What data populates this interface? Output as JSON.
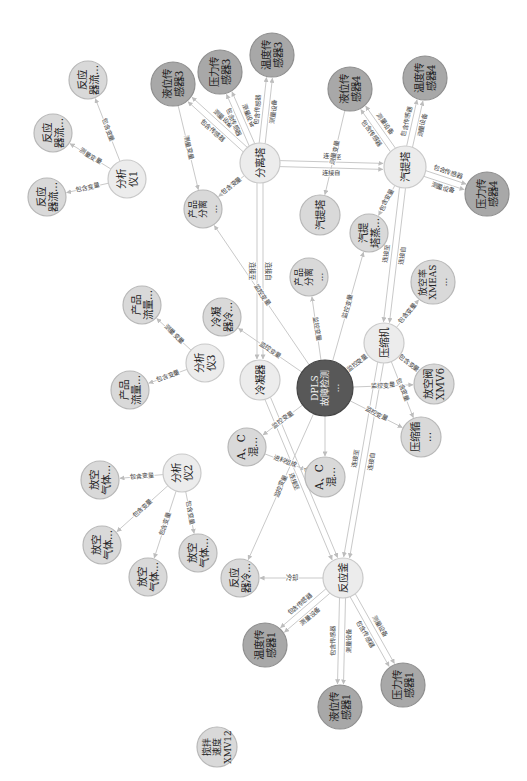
{
  "styles": {
    "edge_color": "#c9c9c9",
    "arrow_color": "#bdbdbd",
    "node_types": {
      "sensor": {
        "fill": "#a8a8a8",
        "stroke": "#8f8f8f",
        "text": "#1e1e1e"
      },
      "core": {
        "fill": "#585858",
        "stroke": "#454545",
        "text": "#f2f2f2"
      },
      "light": {
        "fill": "#ececec",
        "stroke": "#c9c9c9",
        "text": "#242424"
      },
      "medium": {
        "fill": "#d9d9d9",
        "stroke": "#b8b8b8",
        "text": "#242424"
      }
    }
  },
  "graph": {
    "nodes": [
      {
        "id": "fy1a",
        "type": "medium",
        "x": 88,
        "y": 80,
        "r": 19,
        "lines": [
          "反应",
          "器流..."
        ]
      },
      {
        "id": "fy1b",
        "type": "medium",
        "x": 53,
        "y": 133,
        "r": 19,
        "lines": [
          "反应",
          "器流..."
        ]
      },
      {
        "id": "fy1c",
        "type": "medium",
        "x": 47,
        "y": 197,
        "r": 19,
        "lines": [
          "反应",
          "器流..."
        ]
      },
      {
        "id": "fxy1",
        "type": "light",
        "x": 127,
        "y": 179,
        "r": 19,
        "lines": [
          "分析",
          "仪1"
        ]
      },
      {
        "id": "yw3",
        "type": "sensor",
        "x": 173,
        "y": 84,
        "r": 22,
        "lines": [
          "液位传",
          "感器3"
        ]
      },
      {
        "id": "yl3",
        "type": "sensor",
        "x": 220,
        "y": 72,
        "r": 22,
        "lines": [
          "压力传",
          "感器3"
        ]
      },
      {
        "id": "wd3",
        "type": "sensor",
        "x": 272,
        "y": 55,
        "r": 22,
        "lines": [
          "温度传",
          "感器3"
        ]
      },
      {
        "id": "flt",
        "type": "light",
        "x": 260,
        "y": 163,
        "r": 20,
        "lines": [
          "分离塔"
        ]
      },
      {
        "id": "cpfl1",
        "type": "medium",
        "x": 203,
        "y": 209,
        "r": 19,
        "lines": [
          "产品",
          "分离",
          "..."
        ]
      },
      {
        "id": "yw4",
        "type": "sensor",
        "x": 350,
        "y": 89,
        "r": 22,
        "lines": [
          "液位传",
          "感器4"
        ]
      },
      {
        "id": "wd4",
        "type": "sensor",
        "x": 425,
        "y": 78,
        "r": 22,
        "lines": [
          "温度传",
          "感器4"
        ]
      },
      {
        "id": "qtt",
        "type": "light",
        "x": 405,
        "y": 167,
        "r": 21,
        "lines": [
          "汽提塔"
        ]
      },
      {
        "id": "yl4",
        "type": "sensor",
        "x": 487,
        "y": 194,
        "r": 22,
        "lines": [
          "压力传",
          "感器4"
        ]
      },
      {
        "id": "qtt2",
        "type": "medium",
        "x": 320,
        "y": 215,
        "r": 20,
        "lines": [
          "汽提塔"
        ]
      },
      {
        "id": "qtz",
        "type": "medium",
        "x": 369,
        "y": 233,
        "r": 19,
        "lines": [
          "汽提",
          "塔蒸..."
        ]
      },
      {
        "id": "cpfl2",
        "type": "medium",
        "x": 309,
        "y": 277,
        "r": 19,
        "lines": [
          "产品",
          "分离",
          "..."
        ]
      },
      {
        "id": "fkl",
        "type": "medium",
        "x": 433,
        "y": 282,
        "r": 22,
        "lines": [
          "放空率",
          "XMEAS",
          "..."
        ]
      },
      {
        "id": "ysj",
        "type": "light",
        "x": 384,
        "y": 343,
        "r": 20,
        "lines": [
          "压缩机"
        ]
      },
      {
        "id": "dpls",
        "type": "core",
        "x": 325,
        "y": 388,
        "r": 28,
        "lines": [
          "DPLS",
          "故障检测",
          "..."
        ]
      },
      {
        "id": "fkf",
        "type": "medium",
        "x": 434,
        "y": 384,
        "r": 20,
        "lines": [
          "放空阀",
          "XMV6"
        ]
      },
      {
        "id": "ysx",
        "type": "medium",
        "x": 421,
        "y": 437,
        "r": 20,
        "lines": [
          "压缩循",
          "..."
        ]
      },
      {
        "id": "lnq",
        "type": "light",
        "x": 260,
        "y": 380,
        "r": 20,
        "lines": [
          "冷凝器"
        ]
      },
      {
        "id": "lnql",
        "type": "medium",
        "x": 222,
        "y": 317,
        "r": 19,
        "lines": [
          "冷凝",
          "器冷..."
        ]
      },
      {
        "id": "cpll1",
        "type": "medium",
        "x": 142,
        "y": 305,
        "r": 19,
        "lines": [
          "产品",
          "流量..."
        ]
      },
      {
        "id": "fxy3",
        "type": "light",
        "x": 205,
        "y": 363,
        "r": 19,
        "lines": [
          "分析",
          "仪3"
        ]
      },
      {
        "id": "cpll2",
        "type": "medium",
        "x": 130,
        "y": 390,
        "r": 19,
        "lines": [
          "产品",
          "流量..."
        ]
      },
      {
        "id": "ac1",
        "type": "medium",
        "x": 247,
        "y": 447,
        "r": 19,
        "lines": [
          "A、C",
          "混..."
        ]
      },
      {
        "id": "ac2",
        "type": "medium",
        "x": 325,
        "y": 477,
        "r": 20,
        "lines": [
          "A、C",
          "混..."
        ]
      },
      {
        "id": "fxy2",
        "type": "light",
        "x": 182,
        "y": 473,
        "r": 19,
        "lines": [
          "分析",
          "仪2"
        ]
      },
      {
        "id": "fkqt1",
        "type": "medium",
        "x": 100,
        "y": 480,
        "r": 19,
        "lines": [
          "放空",
          "气体..."
        ]
      },
      {
        "id": "fkqt2",
        "type": "medium",
        "x": 102,
        "y": 545,
        "r": 19,
        "lines": [
          "放空",
          "气体..."
        ]
      },
      {
        "id": "fkqt3",
        "type": "medium",
        "x": 148,
        "y": 577,
        "r": 19,
        "lines": [
          "放空",
          "气体..."
        ]
      },
      {
        "id": "fkqt4",
        "type": "medium",
        "x": 198,
        "y": 553,
        "r": 19,
        "lines": [
          "放空",
          "气体..."
        ]
      },
      {
        "id": "fyql",
        "type": "medium",
        "x": 240,
        "y": 578,
        "r": 19,
        "lines": [
          "反应",
          "器冷..."
        ]
      },
      {
        "id": "fyf",
        "type": "light",
        "x": 343,
        "y": 578,
        "r": 20,
        "lines": [
          "反应釜"
        ]
      },
      {
        "id": "wd1",
        "type": "sensor",
        "x": 265,
        "y": 645,
        "r": 22,
        "lines": [
          "温度传",
          "感器1"
        ]
      },
      {
        "id": "yw1",
        "type": "sensor",
        "x": 340,
        "y": 707,
        "r": 22,
        "lines": [
          "液位传",
          "感器1"
        ]
      },
      {
        "id": "yl1",
        "type": "sensor",
        "x": 403,
        "y": 685,
        "r": 22,
        "lines": [
          "压力传",
          "感器1"
        ]
      },
      {
        "id": "jb",
        "type": "medium",
        "x": 217,
        "y": 747,
        "r": 20,
        "lines": [
          "搅拌",
          "速度",
          "XMV12"
        ]
      }
    ],
    "edges": [
      {
        "from": "fxy1",
        "to": "fy1a",
        "labels": [
          "包含变量"
        ]
      },
      {
        "from": "fxy1",
        "to": "fy1b",
        "labels": [
          "测量变量"
        ]
      },
      {
        "from": "fxy1",
        "to": "fy1c",
        "labels": [
          "包含变量"
        ]
      },
      {
        "from": "flt",
        "to": "yw3",
        "labels": [
          "包含传感器",
          "测量设备"
        ]
      },
      {
        "from": "flt",
        "to": "yl3",
        "labels": [
          "包含传感器",
          "测量设备"
        ]
      },
      {
        "from": "flt",
        "to": "wd3",
        "labels": [
          "包含传感器",
          "测量设备"
        ]
      },
      {
        "from": "yw3",
        "to": "cpfl1",
        "labels": [
          "测量变量"
        ]
      },
      {
        "from": "flt",
        "to": "cpfl1",
        "labels": [
          "包含变量"
        ]
      },
      {
        "from": "flt",
        "to": "qtt",
        "labels": [
          "连接至",
          "连接自"
        ]
      },
      {
        "from": "yw4",
        "to": "qtt2",
        "labels": [
          "测量变量"
        ]
      },
      {
        "from": "qtt",
        "to": "yw4",
        "labels": [
          "包含传感器",
          "测量设备"
        ]
      },
      {
        "from": "qtt",
        "to": "wd4",
        "labels": [
          "包含传感器",
          "测量设备"
        ]
      },
      {
        "from": "qtt",
        "to": "yl4",
        "labels": [
          "包含传感器",
          "测量设备"
        ]
      },
      {
        "from": "qtt",
        "to": "qtz",
        "labels": [
          "包含变量"
        ]
      },
      {
        "from": "qtt",
        "to": "ysj",
        "labels": [
          "连接自",
          "连接至"
        ]
      },
      {
        "from": "flt",
        "to": "lnq",
        "labels": [
          "连接自",
          "连接至"
        ]
      },
      {
        "from": "dpls",
        "to": "cpfl1",
        "labels": [
          "监控变量"
        ]
      },
      {
        "from": "dpls",
        "to": "lnql",
        "labels": [
          "监控变量"
        ]
      },
      {
        "from": "dpls",
        "to": "cpfl2",
        "labels": [
          "监控变量"
        ]
      },
      {
        "from": "dpls",
        "to": "qtz",
        "labels": [
          "监控变量"
        ]
      },
      {
        "from": "dpls",
        "to": "ysj",
        "labels": [
          "监控变量"
        ]
      },
      {
        "from": "ysj",
        "to": "fkl",
        "labels": [
          "包含变量"
        ]
      },
      {
        "from": "ysj",
        "to": "fkf",
        "labels": [
          "包含变量"
        ]
      },
      {
        "from": "dpls",
        "to": "fkf",
        "labels": [
          "监控变量"
        ]
      },
      {
        "from": "ysj",
        "to": "ysx",
        "labels": [
          "包含变量"
        ]
      },
      {
        "from": "dpls",
        "to": "ysx",
        "labels": [
          "监控变量"
        ]
      },
      {
        "from": "ysj",
        "to": "fyf",
        "labels": [
          "连接自",
          "连接至"
        ]
      },
      {
        "from": "lnq",
        "to": "fyf",
        "labels": [
          "连接自",
          "连接至"
        ]
      },
      {
        "from": "dpls",
        "to": "ac1",
        "labels": [
          "监控变量"
        ]
      },
      {
        "from": "dpls",
        "to": "ac2",
        "labels": [
          ""
        ]
      },
      {
        "from": "ac1",
        "to": "ac2",
        "labels": [
          "进料组成"
        ]
      },
      {
        "from": "dpls",
        "to": "fyql",
        "labels": [
          "监控变量"
        ]
      },
      {
        "from": "fyf",
        "to": "fyql",
        "labels": [
          "冷却"
        ]
      },
      {
        "from": "fyf",
        "to": "wd1",
        "labels": [
          "测量设备",
          "包含传感器"
        ]
      },
      {
        "from": "fyf",
        "to": "yw1",
        "labels": [
          "测量设备",
          "包含传感器"
        ]
      },
      {
        "from": "fyf",
        "to": "yl1",
        "labels": [
          "测量设备",
          "包含传感器"
        ]
      },
      {
        "from": "fxy3",
        "to": "cpll1",
        "labels": [
          "测量变量"
        ]
      },
      {
        "from": "fxy3",
        "to": "cpll2",
        "labels": [
          "包含变量"
        ]
      },
      {
        "from": "fxy2",
        "to": "fkqt1",
        "labels": [
          "包含变量"
        ]
      },
      {
        "from": "fxy2",
        "to": "fkqt2",
        "labels": [
          "包含变量"
        ]
      },
      {
        "from": "fxy2",
        "to": "fkqt3",
        "labels": [
          "包含变量"
        ]
      },
      {
        "from": "fxy2",
        "to": "fkqt4",
        "labels": [
          "包含变量"
        ]
      }
    ]
  }
}
